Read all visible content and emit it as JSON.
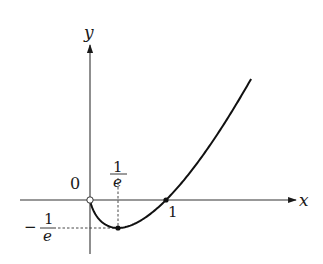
{
  "chart_data": {
    "type": "line",
    "title": "",
    "function": "y = x ln x",
    "xlabel": "x",
    "ylabel": "y",
    "origin_label": "0",
    "xlim": [
      -0.92,
      2.7
    ],
    "ylim": [
      -0.7,
      2.0
    ],
    "grid": false,
    "legend": null,
    "series": [
      {
        "name": "y = x ln x",
        "domain": [
          0,
          2.12
        ],
        "x": [
          0,
          0.05,
          0.1,
          0.2,
          0.3,
          0.3679,
          0.5,
          0.7,
          1.0,
          1.3,
          1.6,
          1.9,
          2.12
        ],
        "y": [
          0,
          -0.15,
          -0.23,
          -0.322,
          -0.361,
          -0.3679,
          -0.347,
          -0.25,
          0,
          0.341,
          0.752,
          1.22,
          1.593
        ]
      }
    ],
    "marked_points": [
      {
        "name": "origin",
        "x": 0,
        "y": 0,
        "style": "open"
      },
      {
        "name": "minimum",
        "x": 0.3679,
        "y": -0.3679,
        "style": "filled"
      },
      {
        "name": "x-intercept",
        "x": 1,
        "y": 0,
        "style": "filled"
      }
    ],
    "tick_labels": {
      "x": [
        {
          "value": 0.3679,
          "num": "1",
          "den": "e"
        },
        {
          "value": 1,
          "text": "1"
        }
      ],
      "y": [
        {
          "value": -0.3679,
          "sign": "−",
          "num": "1",
          "den": "e"
        }
      ]
    },
    "annotations": [
      "dashed guide from (1/e, 0) to minimum",
      "dashed guide from (0, -1/e) to minimum"
    ]
  }
}
